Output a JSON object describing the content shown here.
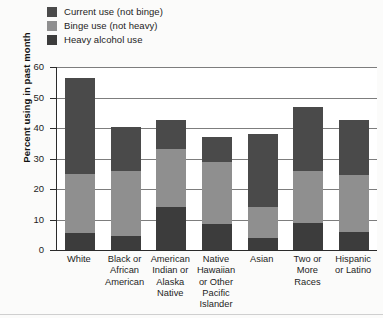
{
  "chart_data": {
    "type": "bar",
    "stacked": true,
    "title": "",
    "xlabel": "",
    "ylabel": "Percent using in past month",
    "ylim": [
      0,
      60
    ],
    "yticks": [
      0,
      10,
      20,
      30,
      40,
      50,
      60
    ],
    "grid": true,
    "legend_position": "top-left",
    "categories": [
      "White",
      "Black or African American",
      "American Indian or Alaska Native",
      "Native Hawaiian or Other Pacific Islander",
      "Asian",
      "Two or More Races",
      "Hispanic or Latino"
    ],
    "category_lines": [
      [
        "White"
      ],
      [
        "Black or",
        "African",
        "American"
      ],
      [
        "American",
        "Indian or",
        "Alaska",
        "Native"
      ],
      [
        "Native",
        "Hawaiian",
        "or Other",
        "Pacific",
        "Islander"
      ],
      [
        "Asian"
      ],
      [
        "Two or",
        "More",
        "Races"
      ],
      [
        "Hispanic",
        "or Latino"
      ]
    ],
    "series": [
      {
        "name": "Current use (not binge)",
        "color": "#4a4a4a",
        "values": [
          31.5,
          14.5,
          9.5,
          8.0,
          24.0,
          21.0,
          18.0
        ]
      },
      {
        "name": "Binge use (not heavy)",
        "color": "#8f8f8f",
        "values": [
          19.5,
          21.5,
          19.0,
          20.5,
          10.0,
          17.0,
          18.5
        ]
      },
      {
        "name": "Heavy alcohol use",
        "color": "#3c3c3c",
        "values": [
          5.5,
          4.5,
          14.0,
          8.5,
          4.0,
          9.0,
          6.0
        ]
      }
    ],
    "totals": [
      56.5,
      40.5,
      42.5,
      37.0,
      38.0,
      47.0,
      42.5
    ]
  },
  "legend": {
    "items": [
      {
        "label": "Current use (not binge)",
        "color": "#4a4a4a",
        "swatch": "legend-swatch-current-use"
      },
      {
        "label": "Binge use (not heavy)",
        "color": "#8f8f8f",
        "swatch": "legend-swatch-binge-use"
      },
      {
        "label": "Heavy alcohol use",
        "color": "#3c3c3c",
        "swatch": "legend-swatch-heavy-use"
      }
    ]
  },
  "axes": {
    "y_title": "Percent using in past month",
    "y_tick_labels": [
      "60",
      "50",
      "40",
      "30",
      "20",
      "10",
      "0"
    ]
  }
}
